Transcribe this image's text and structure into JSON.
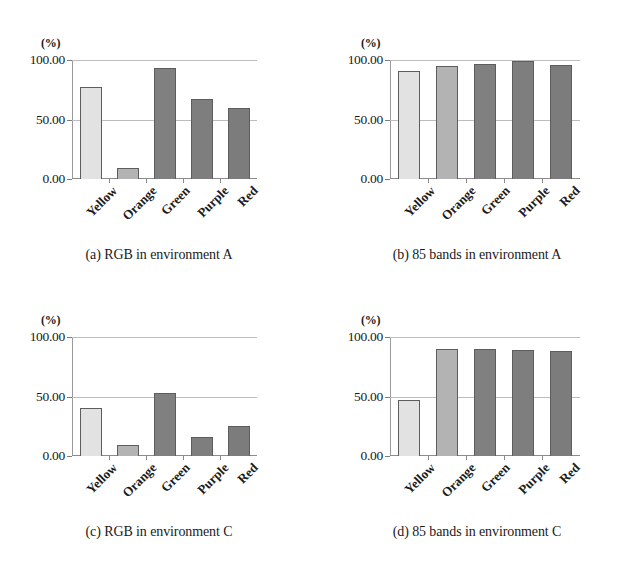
{
  "figure": {
    "unit_label": "(%)",
    "categories": [
      "Yellow",
      "Orange",
      "Green",
      "Purple",
      "Red"
    ],
    "y_ticks": [
      "0.00",
      "50.00",
      "100.00"
    ],
    "colors": {
      "yellow_bar": "#e2e2e2",
      "orange_bar": "#b3b3b3",
      "green_bar": "#808080",
      "purple_bar": "#7e7e7e",
      "red_bar": "#7c7c7c",
      "bar_border": "#5d5d5d",
      "gridline": "#bdbdbd",
      "axis": "#8c8c8c",
      "text": "#1a1a1a",
      "background": "#ffffff"
    },
    "panels": [
      {
        "key": "a",
        "caption": "(a) RGB in environment A"
      },
      {
        "key": "b",
        "caption": "(b) 85 bands in environment A"
      },
      {
        "key": "c",
        "caption": "(c) RGB in environment C"
      },
      {
        "key": "d",
        "caption": "(d) 85 bands in environment C"
      }
    ]
  },
  "chart_data": [
    {
      "type": "bar",
      "panel": "a",
      "title": "(a) RGB in environment A",
      "categories": [
        "Yellow",
        "Orange",
        "Green",
        "Purple",
        "Red"
      ],
      "values": [
        77,
        9,
        93,
        67,
        60
      ],
      "bar_colors": [
        "#e2e2e2",
        "#b3b3b3",
        "#808080",
        "#7e7e7e",
        "#7c7c7c"
      ],
      "xlabel": "",
      "ylabel": "(%)",
      "ylim": [
        0,
        100
      ],
      "yticks": [
        0,
        50,
        100
      ],
      "ytick_labels": [
        "0.00",
        "50.00",
        "100.00"
      ],
      "grid": true,
      "legend": "none"
    },
    {
      "type": "bar",
      "panel": "b",
      "title": "(b) 85 bands in environment A",
      "categories": [
        "Yellow",
        "Orange",
        "Green",
        "Purple",
        "Red"
      ],
      "values": [
        91,
        95,
        97,
        99,
        96
      ],
      "bar_colors": [
        "#e2e2e2",
        "#b3b3b3",
        "#808080",
        "#7e7e7e",
        "#7c7c7c"
      ],
      "xlabel": "",
      "ylabel": "(%)",
      "ylim": [
        0,
        100
      ],
      "yticks": [
        0,
        50,
        100
      ],
      "ytick_labels": [
        "0.00",
        "50.00",
        "100.00"
      ],
      "grid": true,
      "legend": "none"
    },
    {
      "type": "bar",
      "panel": "c",
      "title": "(c) RGB in environment C",
      "categories": [
        "Yellow",
        "Orange",
        "Green",
        "Purple",
        "Red"
      ],
      "values": [
        40,
        9,
        53,
        16,
        25
      ],
      "bar_colors": [
        "#e2e2e2",
        "#b3b3b3",
        "#808080",
        "#7e7e7e",
        "#7c7c7c"
      ],
      "xlabel": "",
      "ylabel": "(%)",
      "ylim": [
        0,
        100
      ],
      "yticks": [
        0,
        50,
        100
      ],
      "ytick_labels": [
        "0.00",
        "50.00",
        "100.00"
      ],
      "grid": true,
      "legend": "none"
    },
    {
      "type": "bar",
      "panel": "d",
      "title": "(d) 85 bands in environment C",
      "categories": [
        "Yellow",
        "Orange",
        "Green",
        "Purple",
        "Red"
      ],
      "values": [
        47,
        90,
        90,
        89,
        88
      ],
      "bar_colors": [
        "#e2e2e2",
        "#b3b3b3",
        "#808080",
        "#7e7e7e",
        "#7c7c7c"
      ],
      "xlabel": "",
      "ylabel": "(%)",
      "ylim": [
        0,
        100
      ],
      "yticks": [
        0,
        50,
        100
      ],
      "ytick_labels": [
        "0.00",
        "50.00",
        "100.00"
      ],
      "grid": true,
      "legend": "none"
    }
  ]
}
